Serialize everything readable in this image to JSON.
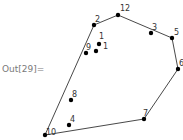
{
  "cell": {
    "out_label": "Out[29]="
  },
  "chart_data": {
    "type": "scatter",
    "title": "",
    "points": [
      {
        "id": "p12",
        "label": "12",
        "x": 118,
        "y": 15
      },
      {
        "id": "p2",
        "label": "2",
        "x": 94,
        "y": 25
      },
      {
        "id": "p3",
        "label": "3",
        "x": 151,
        "y": 33
      },
      {
        "id": "p5",
        "label": "5",
        "x": 172,
        "y": 38
      },
      {
        "id": "p6",
        "label": "6",
        "x": 178,
        "y": 69
      },
      {
        "id": "p7",
        "label": "7",
        "x": 144,
        "y": 119
      },
      {
        "id": "p10",
        "label": "10",
        "x": 45,
        "y": 135
      },
      {
        "id": "p4",
        "label": "4",
        "x": 69,
        "y": 125
      },
      {
        "id": "p8",
        "label": "8",
        "x": 71,
        "y": 100
      },
      {
        "id": "p9",
        "label": "9",
        "x": 86,
        "y": 53
      },
      {
        "id": "p1a",
        "label": "1",
        "x": 99,
        "y": 44
      },
      {
        "id": "p1b",
        "label": "1",
        "x": 96,
        "y": 51
      }
    ],
    "hull": [
      "p10",
      "p2",
      "p12",
      "p5",
      "p6",
      "p7",
      "p10"
    ],
    "colors": {
      "point": "#000000",
      "line": "#333333",
      "label": "#333333"
    }
  }
}
